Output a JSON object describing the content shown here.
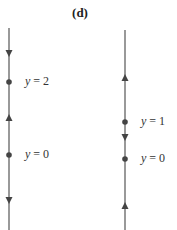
{
  "title": "(d)",
  "colors": {
    "line": "#555555",
    "marker": "#444444",
    "text": "#333333"
  },
  "phase_lines": [
    {
      "id": "left",
      "x": 9,
      "y_top": 28,
      "y_bottom": 230,
      "equilibria": [
        {
          "label": "y = 2",
          "var": "y",
          "value": "2",
          "y_px": 82
        },
        {
          "label": "y = 0",
          "var": "y",
          "value": "0",
          "y_px": 155
        }
      ],
      "arrows": [
        {
          "direction": "down",
          "y_px": 53
        },
        {
          "direction": "up",
          "y_px": 117
        },
        {
          "direction": "down",
          "y_px": 200
        }
      ]
    },
    {
      "id": "right",
      "x": 125,
      "y_top": 30,
      "y_bottom": 230,
      "equilibria": [
        {
          "label": "y = 1",
          "var": "y",
          "value": "1",
          "y_px": 122
        },
        {
          "label": "y = 0",
          "var": "y",
          "value": "0",
          "y_px": 159
        }
      ],
      "arrows": [
        {
          "direction": "up",
          "y_px": 77
        },
        {
          "direction": "down",
          "y_px": 137
        },
        {
          "direction": "up",
          "y_px": 205
        }
      ]
    }
  ]
}
